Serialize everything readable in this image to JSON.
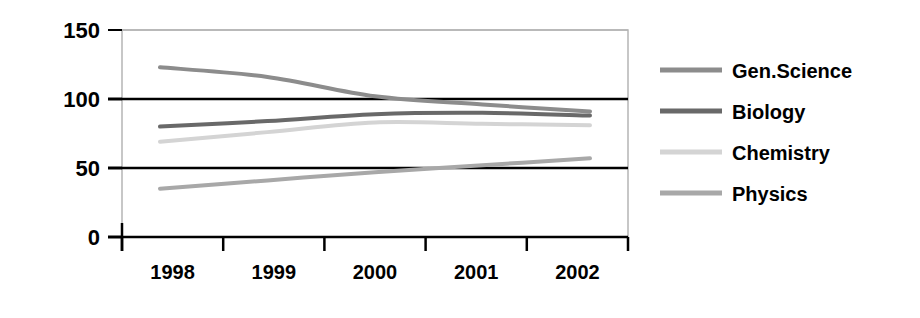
{
  "chart_data": {
    "type": "line",
    "title": "",
    "subtitle": "",
    "xlabel": "",
    "ylabel": "",
    "categories": [
      "1998",
      "1999",
      "2000",
      "2001",
      "2002"
    ],
    "x": [
      1998,
      1999,
      2000,
      2001,
      2002
    ],
    "ylim": [
      0,
      150
    ],
    "xlim": [
      1998,
      2002
    ],
    "y_ticks": [
      0,
      50,
      100,
      150
    ],
    "y_tick_labels": [
      "0",
      "50",
      "100",
      "150"
    ],
    "x_tick_labels": [
      "1998",
      "1999",
      "2000",
      "2001",
      "2002"
    ],
    "grid": true,
    "grid_axis": "y",
    "legend_position": "right",
    "series": [
      {
        "name": "Gen.Science",
        "color": "#8c8c8c",
        "values": [
          123,
          116,
          102,
          96,
          91
        ]
      },
      {
        "name": "Biology",
        "color": "#696969",
        "values": [
          80,
          84,
          89,
          90,
          88
        ]
      },
      {
        "name": "Chemistry",
        "color": "#d4d4d4",
        "values": [
          69,
          76,
          83,
          82,
          81
        ]
      },
      {
        "name": "Physics",
        "color": "#a8a8a8",
        "values": [
          35,
          41,
          47,
          52,
          57
        ]
      }
    ]
  },
  "axes": {
    "y_labels": [
      {
        "text": "150",
        "value": 150
      },
      {
        "text": "100",
        "value": 100
      },
      {
        "text": "50",
        "value": 50
      },
      {
        "text": "0",
        "value": 0
      }
    ],
    "x_labels": [
      {
        "text": "1998"
      },
      {
        "text": "1999"
      },
      {
        "text": "2000"
      },
      {
        "text": "2001"
      },
      {
        "text": "2002"
      }
    ]
  },
  "legend": {
    "items": [
      {
        "label": "Gen.Science",
        "color": "#8c8c8c"
      },
      {
        "label": "Biology",
        "color": "#696969"
      },
      {
        "label": "Chemistry",
        "color": "#d4d4d4"
      },
      {
        "label": "Physics",
        "color": "#a8a8a8"
      }
    ]
  }
}
